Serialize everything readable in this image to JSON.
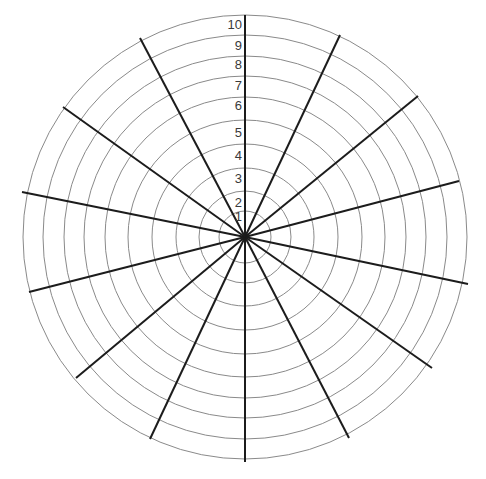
{
  "diagram": {
    "type": "polar-grid",
    "center": [
      245,
      237
    ],
    "ring_color": "#8a8a8a",
    "spoke_color": "#1c1c1c",
    "rings": [
      {
        "label": "1",
        "radius": 26,
        "label_y": 221
      },
      {
        "label": "2",
        "radius": 46,
        "label_y": 207
      },
      {
        "label": "3",
        "radius": 69,
        "label_y": 183
      },
      {
        "label": "4",
        "radius": 93,
        "label_y": 160
      },
      {
        "label": "5",
        "radius": 117,
        "label_y": 137
      },
      {
        "label": "6",
        "radius": 140,
        "label_y": 110
      },
      {
        "label": "7",
        "radius": 161,
        "label_y": 90
      },
      {
        "label": "8",
        "radius": 181,
        "label_y": 69
      },
      {
        "label": "9",
        "radius": 202,
        "label_y": 50
      },
      {
        "label": "10",
        "radius": 222,
        "label_y": 29
      }
    ],
    "spokes": [
      [
        245,
        15
      ],
      [
        340,
        35
      ],
      [
        418,
        96
      ],
      [
        459,
        181
      ],
      [
        468,
        284
      ],
      [
        432,
        368
      ],
      [
        349,
        438
      ],
      [
        245,
        462
      ],
      [
        150,
        439
      ],
      [
        76,
        378
      ],
      [
        29,
        292
      ],
      [
        22,
        192
      ],
      [
        63,
        107
      ],
      [
        140,
        38
      ]
    ]
  }
}
